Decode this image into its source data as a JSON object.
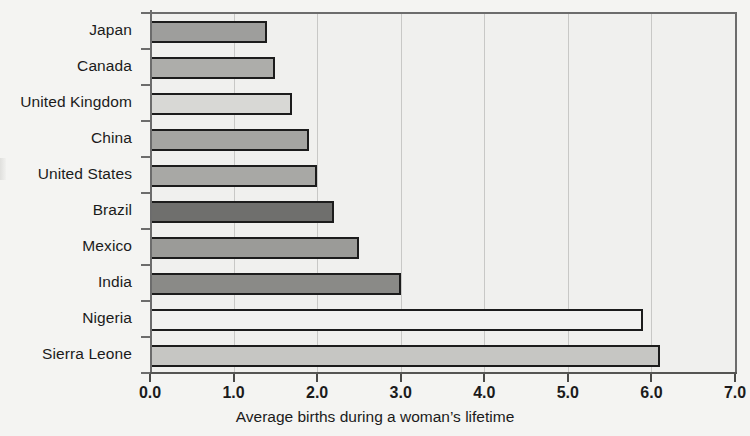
{
  "chart_data": {
    "type": "bar",
    "orientation": "horizontal",
    "title": "",
    "xlabel": "Average births during a woman’s lifetime",
    "ylabel": "",
    "xlim": [
      0.0,
      7.0
    ],
    "xticks": [
      "0.0",
      "1.0",
      "2.0",
      "3.0",
      "4.0",
      "5.0",
      "6.0",
      "7.0"
    ],
    "xtick_values": [
      0,
      1,
      2,
      3,
      4,
      5,
      6,
      7
    ],
    "grid": "vertical",
    "legend": "none",
    "categories": [
      "Japan",
      "Canada",
      "United Kingdom",
      "China",
      "United States",
      "Brazil",
      "Mexico",
      "India",
      "Nigeria",
      "Sierra Leone"
    ],
    "values": [
      1.4,
      1.5,
      1.7,
      1.9,
      2.0,
      2.2,
      2.5,
      3.0,
      5.9,
      6.1
    ],
    "bar_colors": [
      "#9e9e9c",
      "#adadaa",
      "#d8d8d5",
      "#a5a5a2",
      "#a8a8a5",
      "#6f6f6d",
      "#9b9b98",
      "#8a8a87",
      "#f2f2f0",
      "#c6c6c3"
    ],
    "bar_edge_color": "#1c1c1c",
    "plot_background": "#f0f0ee",
    "gridline_color": "#c8c8c6",
    "axis_color": "#6c6c6c"
  }
}
